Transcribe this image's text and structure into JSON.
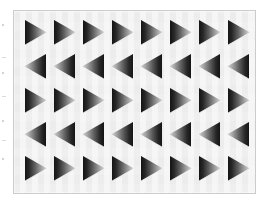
{
  "figure": {
    "background_color": "#ffffff",
    "panel": {
      "background_color": "#efefef",
      "border_color": "#cccccc",
      "left": 13,
      "top": 10,
      "width": 243,
      "height": 184
    },
    "grid": {
      "rows": 5,
      "columns": 8,
      "total_triangles": 40,
      "column_spacing_px": 29,
      "row_spacing_px": 34,
      "cell_width_px": 25,
      "cell_height_px": 27
    },
    "triangle_style": {
      "shape": "right-triangle-arrowhead",
      "shading": "linear-gradient",
      "dark_color": "#1a1a1a",
      "mid_color": "#5e5e5e",
      "light_color": "#d8d8d8",
      "edge_highlight_color": "#f4f4f4",
      "description": "Each triangle is shaded from dark at its flat base edge to light toward its apex."
    },
    "rows": [
      {
        "index": 1,
        "direction": "right",
        "label": "row-1-right-pointing",
        "count": 8
      },
      {
        "index": 2,
        "direction": "left",
        "label": "row-2-left-pointing",
        "count": 8
      },
      {
        "index": 3,
        "direction": "right",
        "label": "row-3-right-pointing",
        "count": 8
      },
      {
        "index": 4,
        "direction": "left",
        "label": "row-4-left-pointing",
        "count": 8
      },
      {
        "index": 5,
        "direction": "right",
        "label": "row-5-right-pointing",
        "count": 8
      }
    ],
    "margin_artifacts": [
      {
        "y": 24,
        "type": "dot"
      },
      {
        "y": 57,
        "type": "tick"
      },
      {
        "y": 72,
        "type": "dot"
      },
      {
        "y": 96,
        "type": "tick"
      },
      {
        "y": 120,
        "type": "dot"
      },
      {
        "y": 140,
        "type": "tick"
      },
      {
        "y": 158,
        "type": "dot"
      }
    ]
  }
}
